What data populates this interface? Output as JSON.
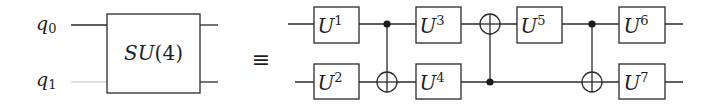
{
  "diagram": {
    "type": "quantum-circuit-equivalence",
    "qubits": [
      {
        "label": "q",
        "subscript": "0"
      },
      {
        "label": "q",
        "subscript": "1"
      }
    ],
    "left_side": {
      "gate": {
        "name": "SU",
        "argument": "(4)",
        "full_label": "SU(4)",
        "spans_qubits": [
          0,
          1
        ]
      }
    },
    "equivalence_symbol": "≡",
    "right_side": {
      "gates": [
        {
          "id": "U1",
          "base": "U",
          "sup": "1",
          "qubit": 0,
          "column": 1
        },
        {
          "id": "U2",
          "base": "U",
          "sup": "2",
          "qubit": 1,
          "column": 1
        },
        {
          "id": "CNOT1",
          "type": "cnot",
          "control": 0,
          "target": 1,
          "column": 2
        },
        {
          "id": "U3",
          "base": "U",
          "sup": "3",
          "qubit": 0,
          "column": 3
        },
        {
          "id": "U4",
          "base": "U",
          "sup": "4",
          "qubit": 1,
          "column": 3
        },
        {
          "id": "CNOT2",
          "type": "cnot",
          "control": 1,
          "target": 0,
          "column": 4
        },
        {
          "id": "U5",
          "base": "U",
          "sup": "5",
          "qubit": 0,
          "column": 5
        },
        {
          "id": "CNOT3",
          "type": "cnot",
          "control": 0,
          "target": 1,
          "column": 6
        },
        {
          "id": "U6",
          "base": "U",
          "sup": "6",
          "qubit": 0,
          "column": 7
        },
        {
          "id": "U7",
          "base": "U",
          "sup": "7",
          "qubit": 1,
          "column": 7
        }
      ]
    },
    "colors": {
      "line": "#2a2a2a",
      "text": "#1e1e1e",
      "faint_wire": "#d8d8d8",
      "background": "#ffffff"
    }
  }
}
